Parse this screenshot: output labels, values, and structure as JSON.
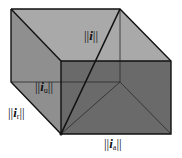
{
  "diagram": {
    "type": "3d-box-vector-decomposition",
    "colors": {
      "background": "#ffffff",
      "top_face": "#a9a9a9",
      "left_face": "#8f8f8f",
      "front_face": "#6a6a6a",
      "inner_back": "#7a7a7a",
      "edge": "#111111",
      "hidden_edge": "#2a2a2a"
    },
    "vertices": {
      "back_top_left": [
        11,
        9
      ],
      "back_top_right": [
        120,
        9
      ],
      "front_top_left": [
        61,
        61
      ],
      "front_top_right": [
        171,
        61
      ],
      "back_bottom_left": [
        11,
        82
      ],
      "back_bottom_right": [
        120,
        82
      ],
      "front_bottom_left": [
        61,
        134
      ],
      "front_bottom_right": [
        171,
        134
      ]
    },
    "labels": [
      {
        "id": "total",
        "bars_left": "||",
        "vector": "i",
        "subscript": "",
        "bars_right": "||",
        "x": 84,
        "y": 29
      },
      {
        "id": "u",
        "bars_left": "||",
        "vector": "i",
        "subscript": "u",
        "bars_right": "||",
        "x": 35,
        "y": 80
      },
      {
        "id": "r",
        "bars_left": "||",
        "vector": "i",
        "subscript": "r",
        "bars_right": "||",
        "x": 8,
        "y": 106
      },
      {
        "id": "a",
        "bars_left": "||",
        "vector": "i",
        "subscript": "a",
        "bars_right": "||",
        "x": 104,
        "y": 134
      }
    ]
  }
}
